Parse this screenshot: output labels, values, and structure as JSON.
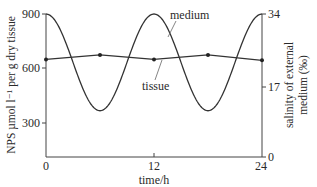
{
  "chart_data": {
    "type": "line",
    "title": "",
    "xlabel": "time/h",
    "ylabel": "NPS µmol l⁻¹ per g  dry tissue",
    "ylabel_right": "salinity of external medium (‰)",
    "xlim": [
      0,
      24
    ],
    "ylim": [
      0,
      900
    ],
    "ylim_right": [
      0,
      34
    ],
    "x_ticks": [
      "0",
      "12",
      "24"
    ],
    "y_ticks": [
      "300",
      "600",
      "900"
    ],
    "y_ticks_right": [
      "0",
      "17",
      "34"
    ],
    "grid": false,
    "legend": "inline annotations",
    "series": [
      {
        "name": "medium",
        "axis": "right",
        "shape": "sinusoid, period 12 h",
        "x": [
          0,
          3,
          6,
          9,
          12,
          15,
          18,
          21,
          24
        ],
        "values": [
          34,
          22.5,
          11,
          22.5,
          34,
          22.5,
          11,
          22.5,
          34
        ]
      },
      {
        "name": "tissue",
        "axis": "left",
        "markers": true,
        "x": [
          0,
          6,
          12,
          18,
          24
        ],
        "values": [
          650,
          675,
          650,
          675,
          645
        ]
      }
    ],
    "annotations": [
      "medium",
      "tissue"
    ]
  },
  "labels": {
    "medium": "medium",
    "tissue": "tissue",
    "xlabel": "time/h",
    "ylabel": "NPS µmol l⁻¹ per g  dry tissue",
    "ylabel_right_1": "salinity of external",
    "ylabel_right_2": "medium (‰)",
    "xt0": "0",
    "xt12": "12",
    "xt24": "24",
    "yt300": "300",
    "yt600": "600",
    "yt900": "900",
    "yr0": "0",
    "yr17": "17",
    "yr34": "34"
  }
}
